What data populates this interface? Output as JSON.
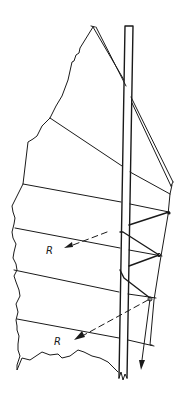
{
  "diagram": {
    "colors": {
      "ink": "#1a1a1a",
      "background": "#ffffff"
    },
    "labels": {
      "force_upper": "R",
      "force_lower": "R"
    }
  }
}
